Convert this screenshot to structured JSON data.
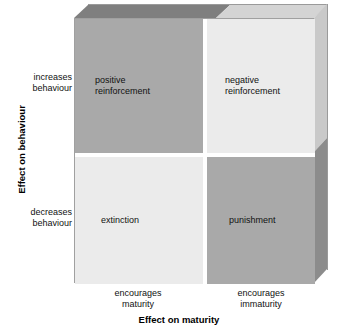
{
  "diagram": {
    "type": "2x2-matrix",
    "title_y_axis": "Effect on behaviour",
    "title_x_axis": "Effect on maturity",
    "y_ticks": [
      {
        "id": "increases",
        "label": "increases\nbehaviour"
      },
      {
        "id": "decreases",
        "label": "decreases\nbehaviour"
      }
    ],
    "x_ticks": [
      {
        "id": "maturity",
        "label": "encourages\nmaturity"
      },
      {
        "id": "immaturity",
        "label": "encourages\nimmaturity"
      }
    ],
    "quadrants": [
      {
        "id": "top-left",
        "label": "positive\nreinforcement",
        "y_level": "increases behaviour",
        "x_level": "encourages maturity",
        "fill": "#a9a9a9"
      },
      {
        "id": "top-right",
        "label": "negative\nreinforcement",
        "y_level": "increases behaviour",
        "x_level": "encourages immaturity",
        "fill": "#ebebeb"
      },
      {
        "id": "bottom-left",
        "label": "extinction",
        "y_level": "decreases behaviour",
        "x_level": "encourages maturity",
        "fill": "#ebebeb"
      },
      {
        "id": "bottom-right",
        "label": "punishment",
        "y_level": "decreases behaviour",
        "x_level": "encourages immaturity",
        "fill": "#a9a9a9"
      }
    ],
    "colors": {
      "dark_cell": "#a9a9a9",
      "light_cell": "#ebebeb",
      "bevel_top_dark": "#7f7f7f",
      "bevel_top_light": "#d4d4d4",
      "bevel_side_light": "#c9c9c9",
      "bevel_side_dark": "#8c8c8c",
      "outline": "#a0a0a0",
      "background": "#ffffff",
      "text": "#111111"
    }
  }
}
